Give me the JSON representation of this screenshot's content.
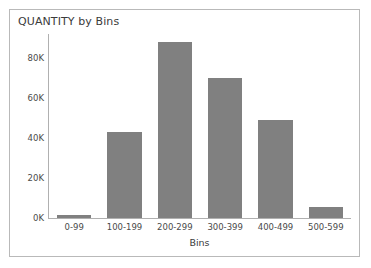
{
  "panel": {
    "border_color": "#b9b9b9",
    "background": "#ffffff"
  },
  "chart_data": {
    "type": "bar",
    "title": "QUANTITY by Bins",
    "xlabel": "Bins",
    "ylabel": "",
    "categories": [
      "0-99",
      "100-199",
      "200-299",
      "300-399",
      "400-499",
      "500-599"
    ],
    "values": [
      1500,
      43000,
      88000,
      70000,
      49000,
      5500
    ],
    "ylim": [
      0,
      92000
    ],
    "yticks": [
      0,
      20000,
      40000,
      60000,
      80000
    ],
    "ytick_labels": [
      "0K",
      "20K",
      "40K",
      "60K",
      "80K"
    ],
    "grid": false,
    "legend": false,
    "bar_color": "#808080",
    "axis_color": "#b0b0b0"
  }
}
